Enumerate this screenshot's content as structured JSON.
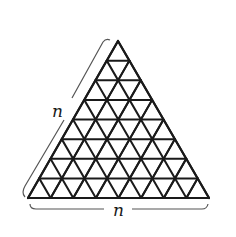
{
  "diagram": {
    "rows": 8,
    "colors": {
      "stroke": "#1a1a1a",
      "bracket": "#555555",
      "background": "#ffffff"
    },
    "geometry": {
      "apex": [
        118,
        41
      ],
      "base_left": [
        28,
        198
      ],
      "base_right": [
        209,
        198
      ]
    },
    "labels": {
      "left_side": "n",
      "bottom_side": "n"
    }
  }
}
